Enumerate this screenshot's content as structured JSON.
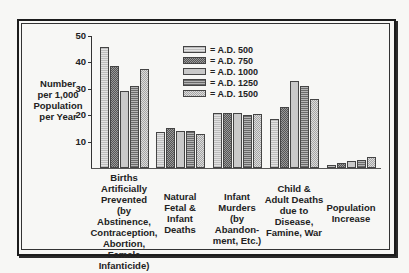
{
  "chart_data": {
    "type": "bar",
    "title": "",
    "xlabel": "",
    "ylabel": "Number per 1,000 Population per Year",
    "ylabel_lines": [
      "Number",
      "per 1,000",
      "Population",
      "per Year"
    ],
    "ylim": [
      0,
      50
    ],
    "yticks": [
      10,
      20,
      30,
      40,
      50
    ],
    "grid": false,
    "legend_position": "upper center",
    "categories": [
      "Births Artificially Prevented (by Abstinence, Contraception, Abortion, Female Infanticide)",
      "Natural Fetal & Infant Deaths",
      "Infant Murders (by Abandonment, Etc.)",
      "Child & Adult Deaths due to Disease, Famine, War",
      "Population Increase"
    ],
    "category_lines": [
      [
        "Births",
        "Artificially",
        "Prevented",
        "(by Abstinence,",
        "Contraception,",
        "Abortion, Female",
        "Infanticide)"
      ],
      [
        "Natural",
        "Fetal &",
        "Infant",
        "Deaths"
      ],
      [
        "Infant",
        "Murders",
        "(by Abandon-",
        "ment, Etc.)"
      ],
      [
        "Child &",
        "Adult Deaths",
        "due to",
        "Disease,",
        "Famine, War"
      ],
      [
        "Population",
        "Increase"
      ]
    ],
    "series": [
      {
        "name": "= A.D. 500",
        "values": [
          46,
          13.5,
          21,
          18.5,
          1
        ]
      },
      {
        "name": "= A.D. 750",
        "values": [
          38.5,
          15,
          21,
          23,
          2
        ]
      },
      {
        "name": "= A.D. 1000",
        "values": [
          29,
          14,
          21,
          33,
          2.5
        ]
      },
      {
        "name": "= A.D. 1250",
        "values": [
          31,
          14,
          20,
          31,
          3
        ]
      },
      {
        "name": "= A.D. 1500",
        "values": [
          37.5,
          13,
          20.5,
          26,
          4
        ]
      }
    ]
  }
}
